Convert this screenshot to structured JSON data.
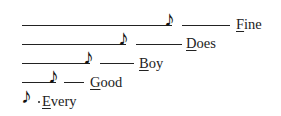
{
  "mnemonic": [
    {
      "word": "Every",
      "initial": "E",
      "rest": "very",
      "note": "♪"
    },
    {
      "word": "Good",
      "initial": "G",
      "rest": "ood",
      "note": "♪"
    },
    {
      "word": "Boy",
      "initial": "B",
      "rest": "oy",
      "note": "♪"
    },
    {
      "word": "Does",
      "initial": "D",
      "rest": "oes",
      "note": "♪"
    },
    {
      "word": "Fine",
      "initial": "F",
      "rest": "ine",
      "note": "♪"
    }
  ]
}
